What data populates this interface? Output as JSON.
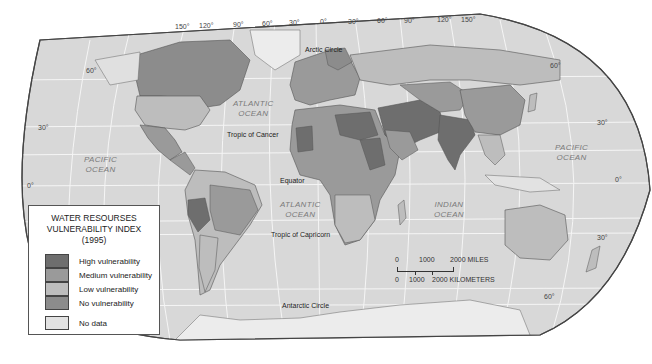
{
  "legend": {
    "title_lines": [
      "WATER RESOURSES",
      "VULNERABILITY INDEX",
      "(1995)"
    ],
    "items": [
      {
        "label": "High vulnerability",
        "color": "#6e6e6e"
      },
      {
        "label": "Medium vulnerability",
        "color": "#9a9a9a"
      },
      {
        "label": "Low vulnerability",
        "color": "#bdbdbd"
      },
      {
        "label": "No vulnerability",
        "color": "#8c8c8c"
      },
      {
        "label": "No data",
        "color": "#e2e2e2"
      }
    ]
  },
  "longitudes": [
    "150°",
    "120°",
    "90°",
    "60°",
    "30°",
    "0°",
    "30°",
    "60°",
    "90°",
    "120°",
    "150°"
  ],
  "latitudes_left": [
    "60°",
    "30°",
    "0°"
  ],
  "latitudes_right": [
    "60°",
    "30°",
    "0°",
    "30°",
    "60°"
  ],
  "lines": {
    "arctic": "Arctic Circle",
    "cancer": "Tropic of Cancer",
    "equator": "Equator",
    "capricorn": "Tropic of Capricorn",
    "antarctic": "Antarctic Circle"
  },
  "oceans": {
    "pacific_west": [
      "PACIFIC",
      "OCEAN"
    ],
    "atlantic_north": [
      "ATLANTIC",
      "OCEAN"
    ],
    "atlantic_south": [
      "ATLANTIC",
      "OCEAN"
    ],
    "indian": [
      "INDIAN",
      "OCEAN"
    ],
    "pacific_east": [
      "PACIFIC",
      "OCEAN"
    ]
  },
  "scale": {
    "miles": [
      "0",
      "1000",
      "2000 MILES"
    ],
    "km": [
      "0",
      "1000",
      "2000 KILOMETERS"
    ]
  },
  "colors": {
    "ocean": "#d9d9d9",
    "land_nodata": "#e2e2e2",
    "high": "#6e6e6e",
    "medium": "#9a9a9a",
    "low": "#bdbdbd",
    "none": "#8c8c8c",
    "graticule": "#f4f4f4"
  }
}
